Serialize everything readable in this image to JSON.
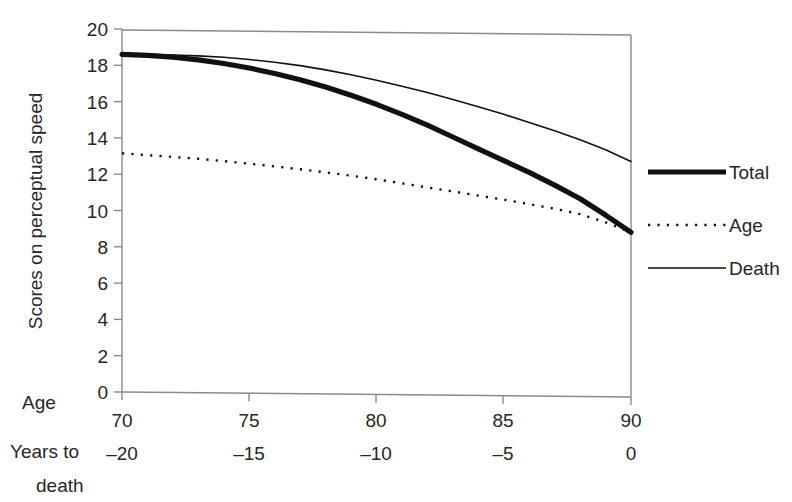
{
  "chart_data": {
    "type": "line",
    "title": "",
    "xlabel": "Age / Years to death",
    "ylabel": "Scores on perceptual speed",
    "xlim": [
      70,
      90
    ],
    "ylim": [
      0,
      20
    ],
    "grid": false,
    "legend_position": "right",
    "x": [
      70,
      71,
      72,
      73,
      74,
      75,
      76,
      77,
      78,
      79,
      80,
      81,
      82,
      83,
      84,
      85,
      86,
      87,
      88,
      89,
      90
    ],
    "x_secondary": [
      -20,
      -19,
      -18,
      -17,
      -16,
      -15,
      -14,
      -13,
      -12,
      -11,
      -10,
      -9,
      -8,
      -7,
      -6,
      -5,
      -4,
      -3,
      -2,
      -1,
      0
    ],
    "series": [
      {
        "name": "Total",
        "style": "thick-solid",
        "values": [
          18.6,
          18.55,
          18.45,
          18.3,
          18.1,
          17.85,
          17.55,
          17.2,
          16.8,
          16.35,
          15.85,
          15.3,
          14.7,
          14.05,
          13.4,
          12.75,
          12.1,
          11.4,
          10.65,
          9.75,
          8.8
        ]
      },
      {
        "name": "Age",
        "style": "dotted",
        "values": [
          13.15,
          13.05,
          12.95,
          12.85,
          12.72,
          12.58,
          12.43,
          12.27,
          12.1,
          11.92,
          11.72,
          11.5,
          11.27,
          11.05,
          10.82,
          10.6,
          10.35,
          10.1,
          9.8,
          9.35,
          8.8
        ]
      },
      {
        "name": "Death",
        "style": "thin-solid",
        "values": [
          18.62,
          18.6,
          18.57,
          18.52,
          18.44,
          18.32,
          18.17,
          17.98,
          17.75,
          17.48,
          17.18,
          16.85,
          16.5,
          16.12,
          15.72,
          15.3,
          14.85,
          14.4,
          13.9,
          13.35,
          12.7
        ]
      }
    ],
    "y_ticks": [
      "0",
      "2",
      "4",
      "6",
      "8",
      "10",
      "12",
      "14",
      "16",
      "18",
      "20"
    ],
    "x_ticks_age": [
      "70",
      "75",
      "80",
      "85",
      "90"
    ],
    "x_ticks_years_to_death": [
      "–20",
      "–15",
      "–10",
      "–5",
      "0"
    ]
  },
  "axes": {
    "y_title": "Scores on perceptual speed",
    "x_caption_age": "Age",
    "x_caption_years_line1": "Years to",
    "x_caption_years_line2": "death"
  },
  "legend": {
    "items": [
      {
        "label": "Total"
      },
      {
        "label": "Age"
      },
      {
        "label": "Death"
      }
    ]
  },
  "colors": {
    "ink": "#111111",
    "frame": "#8a8a8a",
    "background": "#ffffff"
  }
}
